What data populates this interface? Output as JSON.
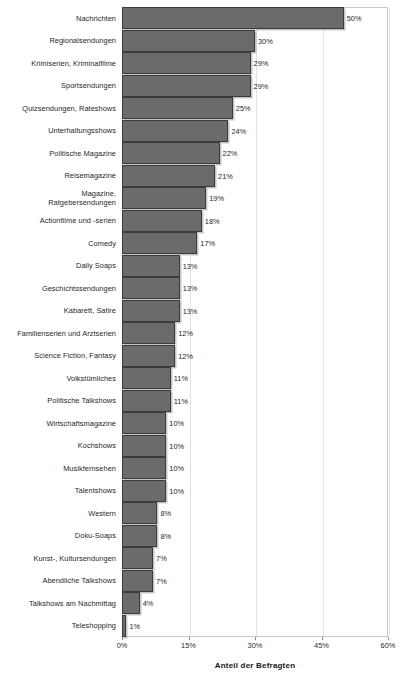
{
  "chart_data": {
    "type": "bar",
    "orientation": "horizontal",
    "title": "",
    "subtitle": "",
    "xlabel": "Anteil der Befragten",
    "ylabel": "",
    "xlim": [
      0,
      60
    ],
    "xticks": [
      0,
      15,
      30,
      45,
      60
    ],
    "xtick_labels": [
      "0%",
      "15%",
      "30%",
      "45%",
      "60%"
    ],
    "grid": true,
    "grid_axis": "x",
    "legend": false,
    "value_label_suffix": "%",
    "bar_color": "#6b6b6b",
    "bar_border_color": "#3b3b3b",
    "categories": [
      "Nachrichten",
      "Regionalsendungen",
      "Krimiserien, Kriminalfilme",
      "Sportsendungen",
      "Quizsendungen, Rateshows",
      "Unterhaltungsshows",
      "Politische Magazine",
      "Reisemagazine",
      "Magazine,\nRatgebersendungen",
      "Actionfilme und -serien",
      "Comedy",
      "Daily Soaps",
      "Geschichtssendungen",
      "Kabarett, Satire",
      "Familienserien und Arztserien",
      "Science Fiction, Fantasy",
      "Volkstümliches",
      "Politische Talkshows",
      "Wirtschaftsmagazine",
      "Kochshows",
      "Musikfernsehen",
      "Talentshows",
      "Western",
      "Doku-Soaps",
      "Kunst-, Kultursendungen",
      "Abendliche Talkshows",
      "Talkshows am Nachmittag",
      "Teleshopping"
    ],
    "values": [
      50,
      30,
      29,
      29,
      25,
      24,
      22,
      21,
      19,
      18,
      17,
      13,
      13,
      13,
      12,
      12,
      11,
      11,
      10,
      10,
      10,
      10,
      8,
      8,
      7,
      7,
      4,
      1
    ],
    "value_labels": [
      "50%",
      "30%",
      "29%",
      "29%",
      "25%",
      "24%",
      "22%",
      "21%",
      "19%",
      "18%",
      "17%",
      "13%",
      "13%",
      "13%",
      "12%",
      "12%",
      "11%",
      "11%",
      "10%",
      "10%",
      "10%",
      "10%",
      "8%",
      "8%",
      "7%",
      "7%",
      "4%",
      "1%"
    ]
  }
}
